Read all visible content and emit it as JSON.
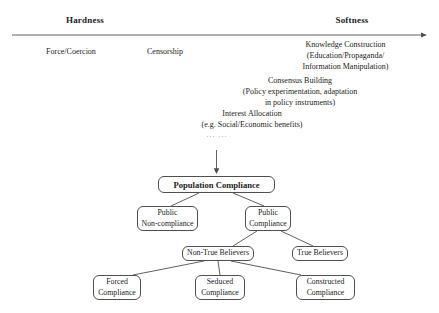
{
  "colors": {
    "ink": "#232323",
    "wire": "#4f4f4f",
    "background": "#ffffff",
    "ellipsis": "#9a9a9a"
  },
  "spectrum": {
    "hardness_label": "Hardness",
    "softness_label": "Softness",
    "instruments": [
      {
        "id": "force-coercion",
        "lines": [
          "Force/Coercion"
        ]
      },
      {
        "id": "censorship",
        "lines": [
          "Censorship"
        ]
      },
      {
        "id": "knowledge-construction",
        "lines": [
          "Knowledge Construction",
          "(Education/Propaganda/",
          "Information Manipulation)"
        ]
      },
      {
        "id": "consensus-building",
        "lines": [
          "Consensus Building",
          "(Policy experimentation, adaptation",
          "in policy instruments)"
        ]
      },
      {
        "id": "interest-allocation",
        "lines": [
          "Interest Allocation",
          "(e.g. Social/Economic benefits)"
        ]
      }
    ],
    "ellipsis": "... ..."
  },
  "tree": {
    "nodes": [
      {
        "id": "population-compliance",
        "lines": [
          "Population Compliance"
        ]
      },
      {
        "id": "public-non-compliance",
        "lines": [
          "Public",
          "Non-compliance"
        ]
      },
      {
        "id": "public-compliance",
        "lines": [
          "Public",
          "Compliance"
        ]
      },
      {
        "id": "non-true-believers",
        "lines": [
          "Non-True Believers"
        ]
      },
      {
        "id": "true-believers",
        "lines": [
          "True Believers"
        ]
      },
      {
        "id": "forced-compliance",
        "lines": [
          "Forced",
          "Compliance"
        ]
      },
      {
        "id": "seduced-compliance",
        "lines": [
          "Seduced",
          "Compliance"
        ]
      },
      {
        "id": "constructed-compliance",
        "lines": [
          "Constructed",
          "Compliance"
        ]
      }
    ]
  }
}
